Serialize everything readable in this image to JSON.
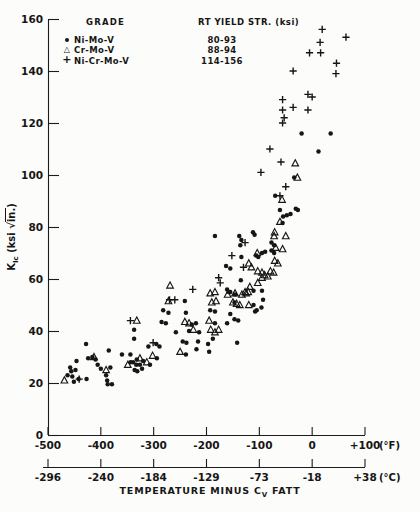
{
  "icons": {
    "filled_circle": "●",
    "open_triangle": "△",
    "plus": "+"
  },
  "legend": {
    "grade_header": "GRADE",
    "yield_header": "RT YIELD STR. (ksi)",
    "rows": [
      {
        "label": "Ni-Mo-V",
        "yield": "80-93",
        "marker": "filled-circle"
      },
      {
        "label": "Cr-Mo-V",
        "yield": "88-94",
        "marker": "open-triangle"
      },
      {
        "label": "Ni-Cr-Mo-V",
        "yield": "114-156",
        "marker": "plus"
      }
    ]
  },
  "ylabel": {
    "k": "K",
    "sub": "Ic",
    "units_open": "(ksi ",
    "sqrt": "√",
    "radicand": "in.",
    "units_close": ")"
  },
  "xtitle": {
    "pre": "TEMPERATURE MINUS C",
    "sub": "V",
    "post": " FATT"
  },
  "chart_data": {
    "type": "scatter",
    "title": "",
    "xlabel": "TEMPERATURE MINUS Cv FATT",
    "ylabel": "KIc (ksi sqrt-in.)",
    "xlim_F": [
      -500,
      100
    ],
    "ylim": [
      0,
      160
    ],
    "grid": false,
    "legend_position": "top-left-inside",
    "y_axis": {
      "ticks": [
        0,
        20,
        40,
        60,
        80,
        100,
        120,
        140,
        160
      ]
    },
    "x_axis_f": {
      "ticks": [
        -500,
        -400,
        -300,
        -200,
        -100,
        0,
        100
      ],
      "labels": [
        "-500",
        "-400",
        "-300",
        "-200",
        "-100",
        "0",
        "+100"
      ],
      "unit": "(°F)"
    },
    "x_axis_c": {
      "labels": [
        "-296",
        "-240",
        "-184",
        "-129",
        "-73",
        "-18",
        "+38"
      ],
      "unit": "(°C)"
    },
    "series": [
      {
        "name": "Ni-Mo-V",
        "marker": "filled-circle",
        "rt_yield_str_ksi": "80-93",
        "points": [
          [
            -463,
            23
          ],
          [
            -458,
            26
          ],
          [
            -456,
            24.5
          ],
          [
            -454,
            22.5
          ],
          [
            -451,
            20.5
          ],
          [
            -448,
            25
          ],
          [
            -446,
            28.5
          ],
          [
            -442,
            21.5
          ],
          [
            -428,
            35
          ],
          [
            -427,
            21.5
          ],
          [
            -424,
            29.5
          ],
          [
            -416,
            30
          ],
          [
            -410,
            29
          ],
          [
            -406,
            27
          ],
          [
            -400,
            25.5
          ],
          [
            -390,
            23
          ],
          [
            -388,
            21
          ],
          [
            -387,
            19.5
          ],
          [
            -385,
            32.5
          ],
          [
            -382,
            26
          ],
          [
            -379,
            19.5
          ],
          [
            -360,
            31
          ],
          [
            -344,
            31
          ],
          [
            -344,
            28
          ],
          [
            -339,
            28
          ],
          [
            -337,
            40.5
          ],
          [
            -337,
            37
          ],
          [
            -336,
            25
          ],
          [
            -333,
            27
          ],
          [
            -332,
            29
          ],
          [
            -331,
            24.5
          ],
          [
            -326,
            27
          ],
          [
            -322,
            25.5
          ],
          [
            -320,
            28.5
          ],
          [
            -310,
            34
          ],
          [
            -307,
            27
          ],
          [
            -295,
            35
          ],
          [
            -294,
            29.5
          ],
          [
            -289,
            34
          ],
          [
            -285,
            43.5
          ],
          [
            -282,
            48
          ],
          [
            -277,
            43
          ],
          [
            -272,
            47
          ],
          [
            -258,
            39.5
          ],
          [
            -245,
            36
          ],
          [
            -241,
            51.5
          ],
          [
            -239,
            47
          ],
          [
            -239,
            31
          ],
          [
            -238,
            35.5
          ],
          [
            -233,
            40
          ],
          [
            -228,
            42.5
          ],
          [
            -220,
            43
          ],
          [
            -219,
            33
          ],
          [
            -216,
            36
          ],
          [
            -214,
            39.5
          ],
          [
            -197,
            35
          ],
          [
            -195,
            32
          ],
          [
            -193,
            48
          ],
          [
            -188,
            37
          ],
          [
            -184,
            47.5
          ],
          [
            -184,
            43
          ],
          [
            -184,
            76.5
          ],
          [
            -163,
            65
          ],
          [
            -161,
            56
          ],
          [
            -161,
            43
          ],
          [
            -158,
            55
          ],
          [
            -155,
            64
          ],
          [
            -155,
            55
          ],
          [
            -155,
            46.5
          ],
          [
            -147,
            51
          ],
          [
            -147,
            44.5
          ],
          [
            -146,
            54
          ],
          [
            -142,
            35.5
          ],
          [
            -140,
            44
          ],
          [
            -138,
            76.5
          ],
          [
            -136,
            73
          ],
          [
            -135,
            59.5
          ],
          [
            -134,
            75
          ],
          [
            -134,
            68.5
          ],
          [
            -112,
            78
          ],
          [
            -111,
            55.5
          ],
          [
            -111,
            50
          ],
          [
            -109,
            77
          ],
          [
            -108,
            47.5
          ],
          [
            -106,
            69
          ],
          [
            -105,
            48
          ],
          [
            -102,
            68.5
          ],
          [
            -96,
            49
          ],
          [
            -95,
            70
          ],
          [
            -95,
            55.5
          ],
          [
            -93,
            52
          ],
          [
            -89,
            70.5
          ],
          [
            -77,
            74
          ],
          [
            -77,
            71
          ],
          [
            -72,
            73
          ],
          [
            -72,
            70
          ],
          [
            -70,
            92
          ],
          [
            -61,
            86.5
          ],
          [
            -56,
            81.5
          ],
          [
            -55,
            84
          ],
          [
            -48,
            84.5
          ],
          [
            -41,
            85
          ],
          [
            -34,
            99
          ],
          [
            -31,
            87
          ],
          [
            -27,
            86.5
          ],
          [
            -20,
            116
          ],
          [
            12,
            109
          ],
          [
            35,
            116
          ]
        ]
      },
      {
        "name": "Cr-Mo-V",
        "marker": "open-triangle",
        "rt_yield_str_ksi": "88-94",
        "points": [
          [
            -469,
            21
          ],
          [
            -413,
            30
          ],
          [
            -390,
            25
          ],
          [
            -349,
            27
          ],
          [
            -332,
            44
          ],
          [
            -326,
            29.5
          ],
          [
            -313,
            28
          ],
          [
            -302,
            30.5
          ],
          [
            -272,
            51.5
          ],
          [
            -269,
            57.5
          ],
          [
            -250,
            32
          ],
          [
            -241,
            43.5
          ],
          [
            -233,
            43
          ],
          [
            -225,
            40.5
          ],
          [
            -195,
            44
          ],
          [
            -193,
            54.5
          ],
          [
            -192,
            40.5
          ],
          [
            -190,
            51
          ],
          [
            -184,
            55
          ],
          [
            -184,
            39.5
          ],
          [
            -182,
            51.5
          ],
          [
            -177,
            40.5
          ],
          [
            -160,
            54
          ],
          [
            -150,
            51
          ],
          [
            -146,
            54.5
          ],
          [
            -143,
            50.5
          ],
          [
            -137,
            50
          ],
          [
            -133,
            54
          ],
          [
            -127,
            55
          ],
          [
            -125,
            54.5
          ],
          [
            -121,
            55
          ],
          [
            -120,
            66
          ],
          [
            -120,
            50
          ],
          [
            -118,
            57
          ],
          [
            -115,
            64.5
          ],
          [
            -104,
            70
          ],
          [
            -103,
            63
          ],
          [
            -103,
            58.5
          ],
          [
            -95,
            62.5
          ],
          [
            -95,
            60.5
          ],
          [
            -90,
            61.5
          ],
          [
            -84,
            61
          ],
          [
            -79,
            63
          ],
          [
            -73,
            62.5
          ],
          [
            -71,
            78
          ],
          [
            -71,
            67
          ],
          [
            -65,
            66
          ],
          [
            -61,
            82
          ],
          [
            -57,
            90.5
          ],
          [
            -56,
            71.5
          ],
          [
            -50,
            76.5
          ],
          [
            -72,
            76.5
          ],
          [
            -69,
            72
          ],
          [
            -32,
            104.5
          ],
          [
            -28,
            99
          ]
        ]
      },
      {
        "name": "Ni-Cr-Mo-V",
        "marker": "plus",
        "rt_yield_str_ksi": "114-156",
        "points": [
          [
            -441,
            21.5
          ],
          [
            -344,
            44
          ],
          [
            -301,
            35.5
          ],
          [
            -270,
            52
          ],
          [
            -260,
            52
          ],
          [
            -226,
            56
          ],
          [
            -177,
            60.5
          ],
          [
            -174,
            58.5
          ],
          [
            -152,
            69
          ],
          [
            -130,
            64.5
          ],
          [
            -127,
            74
          ],
          [
            -97,
            101
          ],
          [
            -80,
            110
          ],
          [
            -61,
            92
          ],
          [
            -59,
            105
          ],
          [
            -56,
            129
          ],
          [
            -56,
            125
          ],
          [
            -56,
            120
          ],
          [
            -53,
            122
          ],
          [
            -50,
            95.5
          ],
          [
            -36,
            140
          ],
          [
            -36,
            126
          ],
          [
            -8,
            131
          ],
          [
            -8,
            125
          ],
          [
            -5,
            147
          ],
          [
            0,
            130
          ],
          [
            15,
            151
          ],
          [
            16,
            147
          ],
          [
            19,
            156
          ],
          [
            45,
            139
          ],
          [
            46,
            143
          ],
          [
            64,
            153
          ]
        ]
      }
    ]
  }
}
